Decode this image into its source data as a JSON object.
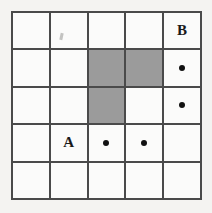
{
  "figure": {
    "rows": 5,
    "columns": 5,
    "colors": {
      "background": "#f4f3f1",
      "cell_fill": "#fbfbfa",
      "shaded_fill": "#9b9b9b",
      "grid_line": "#4a4a4a",
      "marker": "#111111",
      "label_text": "#1a1a1a"
    },
    "cells": [
      {
        "row": 1,
        "col": 1,
        "shaded": false,
        "label": "",
        "dot": false
      },
      {
        "row": 1,
        "col": 2,
        "shaded": false,
        "label": "",
        "dot": false
      },
      {
        "row": 1,
        "col": 3,
        "shaded": false,
        "label": "",
        "dot": false
      },
      {
        "row": 1,
        "col": 4,
        "shaded": false,
        "label": "",
        "dot": false
      },
      {
        "row": 1,
        "col": 5,
        "shaded": false,
        "label": "B",
        "dot": false
      },
      {
        "row": 2,
        "col": 1,
        "shaded": false,
        "label": "",
        "dot": false
      },
      {
        "row": 2,
        "col": 2,
        "shaded": false,
        "label": "",
        "dot": false
      },
      {
        "row": 2,
        "col": 3,
        "shaded": true,
        "label": "",
        "dot": false
      },
      {
        "row": 2,
        "col": 4,
        "shaded": true,
        "label": "",
        "dot": false
      },
      {
        "row": 2,
        "col": 5,
        "shaded": false,
        "label": "",
        "dot": true
      },
      {
        "row": 3,
        "col": 1,
        "shaded": false,
        "label": "",
        "dot": false
      },
      {
        "row": 3,
        "col": 2,
        "shaded": false,
        "label": "",
        "dot": false
      },
      {
        "row": 3,
        "col": 3,
        "shaded": true,
        "label": "",
        "dot": false
      },
      {
        "row": 3,
        "col": 4,
        "shaded": false,
        "label": "",
        "dot": false
      },
      {
        "row": 3,
        "col": 5,
        "shaded": false,
        "label": "",
        "dot": true
      },
      {
        "row": 4,
        "col": 1,
        "shaded": false,
        "label": "",
        "dot": false
      },
      {
        "row": 4,
        "col": 2,
        "shaded": false,
        "label": "A",
        "dot": false
      },
      {
        "row": 4,
        "col": 3,
        "shaded": false,
        "label": "",
        "dot": true
      },
      {
        "row": 4,
        "col": 4,
        "shaded": false,
        "label": "",
        "dot": true
      },
      {
        "row": 4,
        "col": 5,
        "shaded": false,
        "label": "",
        "dot": false
      },
      {
        "row": 5,
        "col": 1,
        "shaded": false,
        "label": "",
        "dot": false
      },
      {
        "row": 5,
        "col": 2,
        "shaded": false,
        "label": "",
        "dot": false
      },
      {
        "row": 5,
        "col": 3,
        "shaded": false,
        "label": "",
        "dot": false
      },
      {
        "row": 5,
        "col": 4,
        "shaded": false,
        "label": "",
        "dot": false
      },
      {
        "row": 5,
        "col": 5,
        "shaded": false,
        "label": "",
        "dot": false
      }
    ]
  }
}
